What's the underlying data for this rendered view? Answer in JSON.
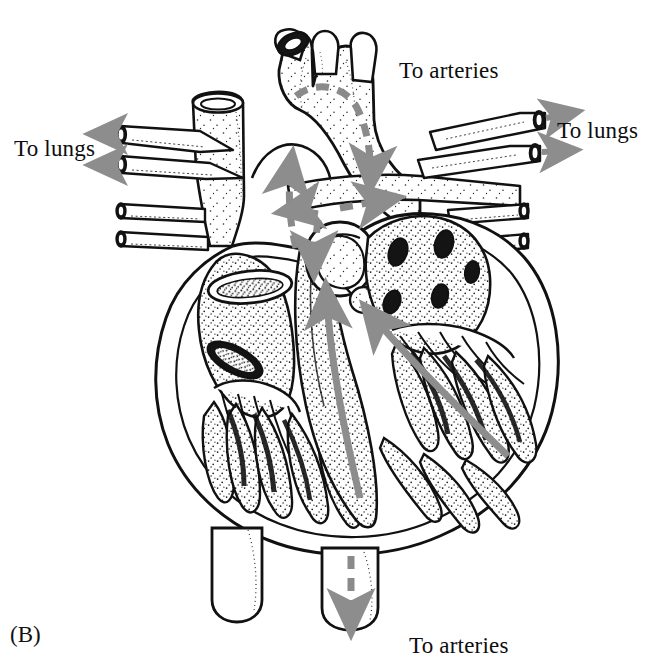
{
  "figure": {
    "caption": "(B)",
    "style": "black-and-white stippled anatomical line drawing",
    "background_color": "#ffffff",
    "ink_color": "#111111",
    "arrow_color": "#8a8a8a"
  },
  "labels": {
    "to_lungs_left": "To lungs",
    "to_lungs_right": "To lungs",
    "to_arteries_top": "To arteries",
    "to_arteries_bottom": "To arteries"
  },
  "flow_arrows": [
    {
      "name": "to-lungs-left-upper",
      "style": "solid-stippled",
      "direction": "left",
      "color": "#8a8a8a"
    },
    {
      "name": "to-lungs-left-lower",
      "style": "solid-stippled",
      "direction": "left",
      "color": "#8a8a8a"
    },
    {
      "name": "to-lungs-right-upper",
      "style": "solid-stippled",
      "direction": "right",
      "color": "#8a8a8a"
    },
    {
      "name": "to-lungs-right-lower",
      "style": "solid-stippled",
      "direction": "right",
      "color": "#8a8a8a"
    },
    {
      "name": "aortic-arch-dashed",
      "style": "dashed",
      "direction": "over-arch-down-right",
      "color": "#8a8a8a"
    },
    {
      "name": "ascending-aorta-dashed",
      "style": "dashed",
      "direction": "up-left",
      "color": "#8a8a8a"
    },
    {
      "name": "pulmonary-trunk-dashed",
      "style": "dashed",
      "direction": "right",
      "color": "#8a8a8a"
    },
    {
      "name": "outflow-split-dashed",
      "style": "dashed",
      "direction": "down-left-and-down",
      "color": "#8a8a8a"
    },
    {
      "name": "left-ventricle-solid",
      "style": "solid",
      "direction": "up",
      "color": "#8a8a8a"
    },
    {
      "name": "right-ventricle-solid",
      "style": "solid",
      "direction": "up-left",
      "color": "#8a8a8a"
    },
    {
      "name": "descending-aorta-dashed",
      "style": "dashed",
      "direction": "down",
      "color": "#8a8a8a"
    }
  ],
  "anatomy_parts": [
    "aortic-arch",
    "brachiocephalic-branch",
    "left-common-carotid-branch",
    "left-subclavian-branch",
    "superior-vena-cava",
    "pulmonary-artery-left-branches",
    "pulmonary-artery-right-branches",
    "pulmonary-veins-left",
    "pulmonary-veins-right",
    "left-atrium",
    "right-atrium",
    "left-ventricle",
    "right-ventricle",
    "interventricular-septum",
    "semilunar-valve",
    "atrioventricular-valve-cusps",
    "chordae-tendineae",
    "papillary-muscles",
    "trabeculae-carneae",
    "myocardium-wall",
    "descending-aorta-stub",
    "inferior-vena-cava-stub"
  ]
}
